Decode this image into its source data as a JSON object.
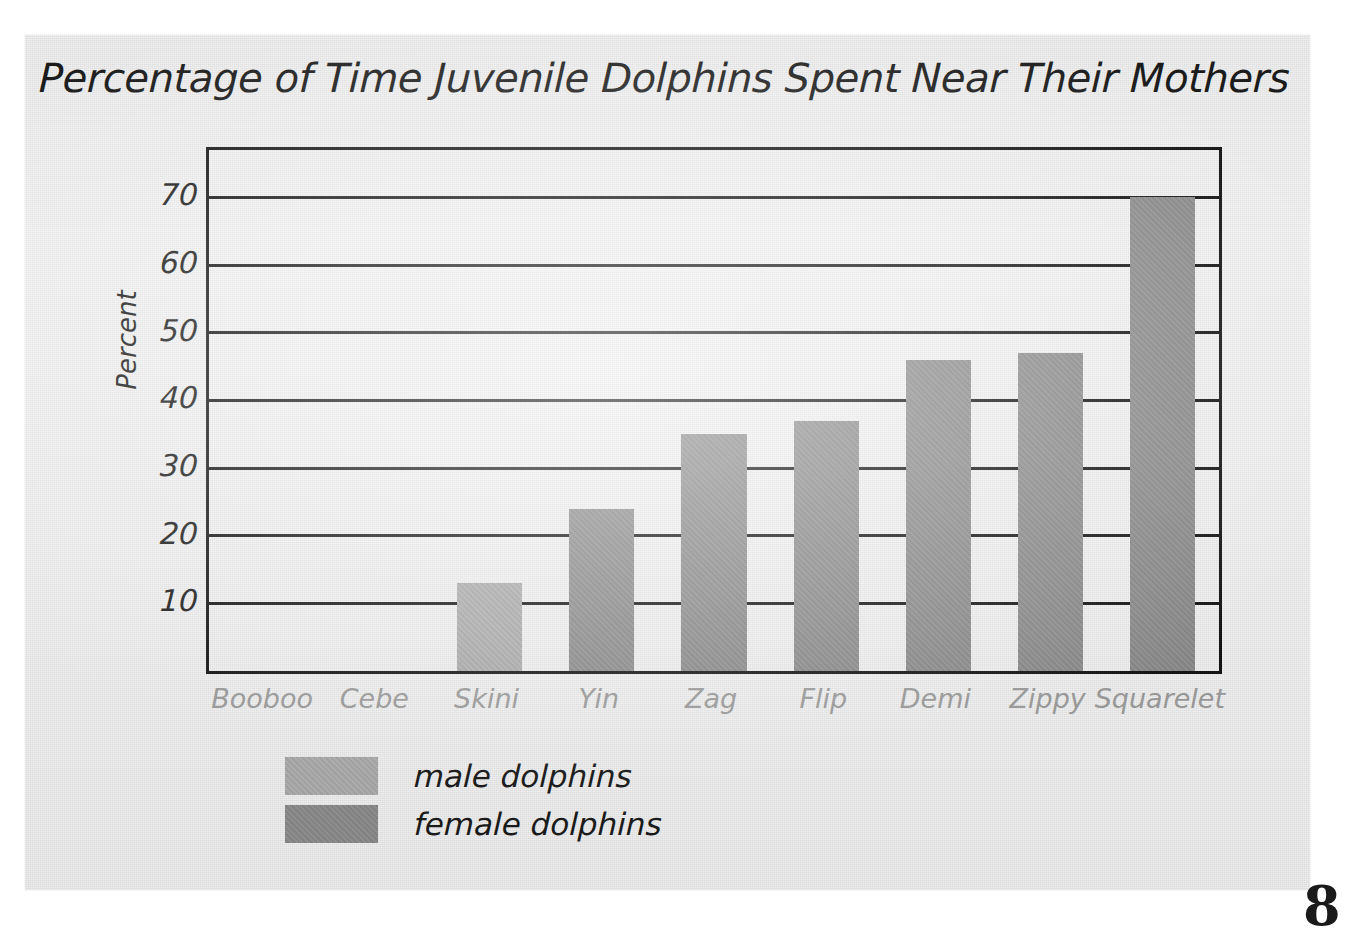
{
  "chart_data": {
    "type": "bar",
    "title": "Percentage of Time Juvenile Dolphins Spent Near Their Mothers",
    "xlabel": "",
    "ylabel": "Percent",
    "categories": [
      "Booboo",
      "Cebe",
      "Skini",
      "Yin",
      "Zag",
      "Flip",
      "Demi",
      "Zippy",
      "Squarelet"
    ],
    "values": [
      0,
      0,
      13,
      24,
      35,
      37,
      46,
      47,
      70
    ],
    "groups": [
      "male",
      "male",
      "male",
      "female",
      "female",
      "female",
      "female",
      "female",
      "female"
    ],
    "ylim": [
      0,
      77
    ],
    "yticks": [
      10,
      20,
      30,
      40,
      50,
      60,
      70
    ],
    "ytick_labels": [
      "10",
      "20",
      "30",
      "40",
      "50",
      "60",
      "70"
    ],
    "grid": true,
    "legend_position": "bottom-left",
    "legend": [
      {
        "label": "male dolphins",
        "color": "#ababab",
        "key": "male"
      },
      {
        "label": "female dolphins",
        "color": "#8a8a8a",
        "key": "female"
      }
    ]
  },
  "colors": {
    "male_bar": "#ababab",
    "female_bar": "#8a8a8a",
    "axis": "#141414",
    "title_text": "#1b1b1b",
    "ytick_text": "#1c1c1c",
    "xtick_text": "#9a9a9a",
    "page_background": "#e8e9e8",
    "outer_background": "#ffffff"
  },
  "corner_mark": "8"
}
